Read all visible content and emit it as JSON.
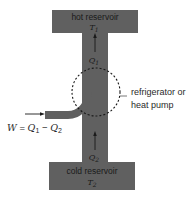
{
  "diagram": {
    "colors": {
      "reservoir_fill": "#606060",
      "arrow": "#1a1a1a",
      "text": "#2a2a2a",
      "dashed_circle": "#1a1a1a",
      "background": "#ffffff"
    },
    "hot_reservoir": {
      "label": "hot reservoir",
      "temperature_symbol": "T",
      "temperature_subscript": "1"
    },
    "cold_reservoir": {
      "label": "cold reservoir",
      "temperature_symbol": "T",
      "temperature_subscript": "2"
    },
    "heat_flow_top": {
      "symbol": "Q",
      "subscript": "1",
      "direction": "up"
    },
    "heat_flow_bottom": {
      "symbol": "Q",
      "subscript": "2",
      "direction": "up"
    },
    "device_label": {
      "line1": "refrigerator or",
      "line2": "heat pump"
    },
    "work_input": {
      "W": "W",
      "equals": " = ",
      "Q1": "Q",
      "Q1_sub": "1",
      "minus": " − ",
      "Q2": "Q",
      "Q2_sub": "2",
      "direction": "right"
    }
  }
}
